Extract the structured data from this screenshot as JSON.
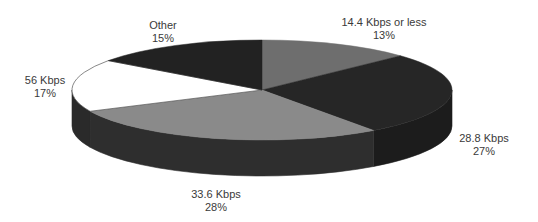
{
  "chart_data": {
    "type": "pie",
    "style": "3d",
    "title": "",
    "categories": [
      "14.4 Kbps or less",
      "28.8 Kbps",
      "33.6 Kbps",
      "56 Kbps",
      "Other"
    ],
    "values": [
      13,
      27,
      28,
      17,
      15
    ],
    "unit": "%",
    "legend": "none (direct labels)",
    "slices": [
      {
        "label": "14.4 Kbps or less",
        "value": 13,
        "color": "#6e6e6e",
        "side_color": "#3a3a3a"
      },
      {
        "label": "28.8 Kbps",
        "value": 27,
        "color": "#262626",
        "side_color": "#1c1c1c"
      },
      {
        "label": "33.6 Kbps",
        "value": 28,
        "color": "#8a8a8a",
        "side_color": "#2e2e2e"
      },
      {
        "label": "56 Kbps",
        "value": 17,
        "color": "#ffffff",
        "side_color": "#2a2a2a"
      },
      {
        "label": "Other",
        "value": 15,
        "color": "#222222",
        "side_color": "#1e1e1e"
      }
    ]
  },
  "labels": {
    "s144": {
      "name": "14.4 Kbps or less",
      "pct": "13%"
    },
    "s288": {
      "name": "28.8 Kbps",
      "pct": "27%"
    },
    "s336": {
      "name": "33.6 Kbps",
      "pct": "28%"
    },
    "s56": {
      "name": "56 Kbps",
      "pct": "17%"
    },
    "other": {
      "name": "Other",
      "pct": "15%"
    }
  }
}
